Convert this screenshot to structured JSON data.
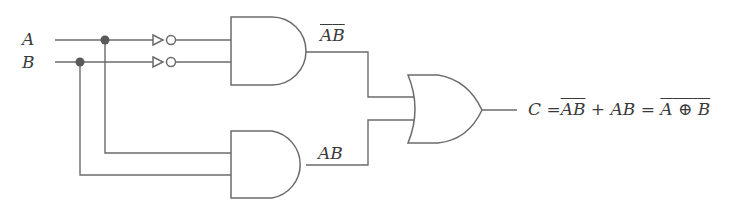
{
  "inputs": {
    "a_label": "A",
    "b_label": "B"
  },
  "gates": {
    "top_and_output_label": {
      "a": "A",
      "b": "B",
      "note": "A-bar B-bar"
    },
    "bottom_and_output_label": "AB",
    "inverters": [
      "NOT A",
      "NOT B"
    ],
    "or_gate": "OR"
  },
  "output_equation": {
    "lhs": "C",
    "eq1": "=",
    "term1_a": "A",
    "term1_b": "B",
    "plus": "+",
    "term2": "AB",
    "eq2": "=",
    "xor_a": "A",
    "xor_op": "⊕",
    "xor_b": "B"
  },
  "colors": {
    "wire": "#6b6b6b",
    "junction": "#5a5a5a",
    "text": "#3a3a3a"
  }
}
